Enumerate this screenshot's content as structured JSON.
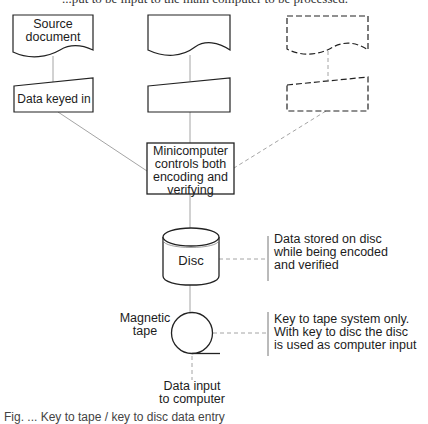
{
  "page": {
    "clipped_top_text": "...put to be input to the main computer to be processed.",
    "clipped_bottom_text": "Fig. ... Key to tape / key to disc data entry"
  },
  "diagram": {
    "columns": [
      {
        "document_label": "Source\ndocument",
        "input_label": "Data keyed in",
        "style": "solid"
      },
      {
        "document_label": "",
        "input_label": "",
        "style": "solid"
      },
      {
        "document_label": "",
        "input_label": "",
        "style": "dashed"
      }
    ],
    "processor": {
      "label_lines": [
        "Minicomputer",
        "controls both",
        "encoding and",
        "verifying"
      ]
    },
    "disc": {
      "label": "Disc",
      "annotation_lines": [
        "Data stored on disc",
        "while being encoded",
        "and verified"
      ]
    },
    "tape": {
      "label_lines": [
        "Magnetic",
        "tape"
      ],
      "annotation_lines": [
        "Key to tape system only.",
        "With key to disc the disc",
        "is used as computer input"
      ]
    },
    "output": {
      "label_lines": [
        "Data input",
        "to computer"
      ]
    }
  }
}
